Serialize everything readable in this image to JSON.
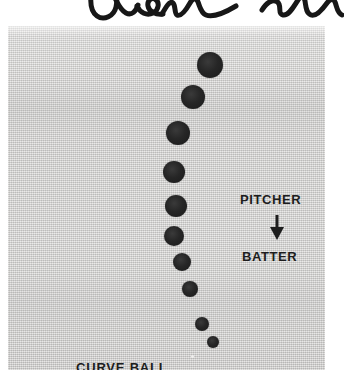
{
  "page": {
    "background_color": "#ffffff",
    "width": 344,
    "height": 378
  },
  "handwriting": {
    "present": true,
    "description": "cursive-ink-annotation",
    "legible_text": "Olon",
    "color": "#1a1a1a",
    "note": "handwritten cursive in ink across top margin, cropped at image edge"
  },
  "photo": {
    "name": "curve-ball-stroboscopic-photograph",
    "frame": {
      "x": 8,
      "y": 26,
      "width": 317,
      "height": 344
    },
    "paper_color": "#d5d4d2",
    "ball_color": "#1f1f1f",
    "labels": {
      "pitcher": "PITCHER",
      "batter": "BATTER",
      "caption": "CURVE BALL"
    },
    "arrow": {
      "direction": "down",
      "meaning": "ball travels from pitcher toward batter"
    }
  },
  "chart_data": {
    "type": "scatter",
    "title": "CURVE BALL",
    "xlabel": "",
    "ylabel": "",
    "annotations": [
      "PITCHER",
      "BATTER"
    ],
    "balls": [
      {
        "index": 1,
        "cx": 202,
        "cy": 39,
        "r": 13
      },
      {
        "index": 2,
        "cx": 185,
        "cy": 71,
        "r": 12
      },
      {
        "index": 3,
        "cx": 170,
        "cy": 107,
        "r": 12
      },
      {
        "index": 4,
        "cx": 166,
        "cy": 146,
        "r": 11
      },
      {
        "index": 5,
        "cx": 168,
        "cy": 180,
        "r": 11
      },
      {
        "index": 6,
        "cx": 166,
        "cy": 210,
        "r": 10
      },
      {
        "index": 7,
        "cx": 174,
        "cy": 236,
        "r": 9
      },
      {
        "index": 8,
        "cx": 182,
        "cy": 263,
        "r": 8
      },
      {
        "index": 9,
        "cx": 194,
        "cy": 298,
        "r": 7
      },
      {
        "index": 10,
        "cx": 205,
        "cy": 316,
        "r": 6
      }
    ]
  }
}
